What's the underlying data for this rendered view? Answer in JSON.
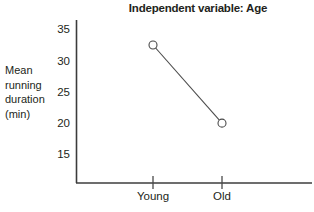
{
  "chart_data": {
    "type": "line",
    "title": "Independent variable: Age",
    "xlabel": "",
    "ylabel": "Mean running duration (min)",
    "ylabel_lines": [
      "Mean",
      "running",
      "duration",
      "(min)"
    ],
    "categories": [
      "Young",
      "Old"
    ],
    "values": [
      32.5,
      20.0
    ],
    "ylim": [
      12.5,
      36.5
    ],
    "yticks": [
      35,
      30,
      25,
      20,
      15
    ],
    "ytick_labels": [
      "35",
      "30",
      "25",
      "20",
      "15"
    ],
    "grid": false,
    "legend": false,
    "marker": "open-circle",
    "series": [
      {
        "name": "Mean running duration",
        "values": [
          32.5,
          20.0
        ]
      }
    ],
    "colors": {
      "line": "#4a4a4a",
      "marker_stroke": "#4a4a4a",
      "marker_fill": "#ffffff",
      "axis": "#3c3c3c",
      "text": "#231f20",
      "background": "#ffffff"
    }
  }
}
